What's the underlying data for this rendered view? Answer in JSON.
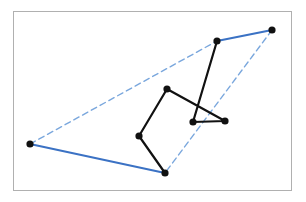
{
  "figure": {
    "title": "",
    "frame": {
      "x": 13,
      "y": 11,
      "width": 279,
      "height": 180,
      "border_color": "#b0b0b0",
      "background": "#ffffff"
    },
    "canvas": {
      "width": 306,
      "height": 202
    }
  },
  "chart_data": {
    "type": "scatter",
    "title": "",
    "xlabel": "",
    "ylabel": "",
    "grid": false,
    "legend": "none",
    "xlim": [
      13,
      292
    ],
    "ylim": [
      11,
      191
    ],
    "points": [
      {
        "id": "p0",
        "label": "left-extreme",
        "x": 30,
        "y": 144
      },
      {
        "id": "p1",
        "label": "bottom-extreme",
        "x": 165,
        "y": 173
      },
      {
        "id": "p2",
        "label": "lower-left-inner",
        "x": 139,
        "y": 136
      },
      {
        "id": "p3",
        "label": "upper-middle-inner",
        "x": 167,
        "y": 89
      },
      {
        "id": "p4",
        "label": "center-right-inner",
        "x": 193,
        "y": 122
      },
      {
        "id": "p5",
        "label": "right-inner",
        "x": 225,
        "y": 121
      },
      {
        "id": "p6",
        "label": "upper-hull-vertex",
        "x": 217,
        "y": 41
      },
      {
        "id": "p7",
        "label": "right-extreme",
        "x": 272,
        "y": 30
      }
    ],
    "point_style": {
      "color": "#111111",
      "radius": 3.6,
      "marker": "circle"
    },
    "path_black": {
      "name": "point-connection-path",
      "color": "#111111",
      "width": 2.2,
      "style": "solid",
      "vertex_ids": [
        "p1",
        "p2",
        "p3",
        "p5",
        "p4",
        "p6"
      ]
    },
    "hull_solid": {
      "name": "hull-solid-edges",
      "color": "#3b72c4",
      "width": 2.0,
      "style": "solid",
      "segments": [
        {
          "from": "p0",
          "to": "p1"
        },
        {
          "from": "p6",
          "to": "p7"
        }
      ]
    },
    "hull_dashed": {
      "name": "hull-dashed-edges",
      "color": "#7aa7dd",
      "width": 1.4,
      "style": "dashed",
      "dash": "6,4",
      "segments": [
        {
          "from": "p0",
          "to": "p6"
        },
        {
          "from": "p7",
          "to": "p1"
        }
      ]
    }
  }
}
